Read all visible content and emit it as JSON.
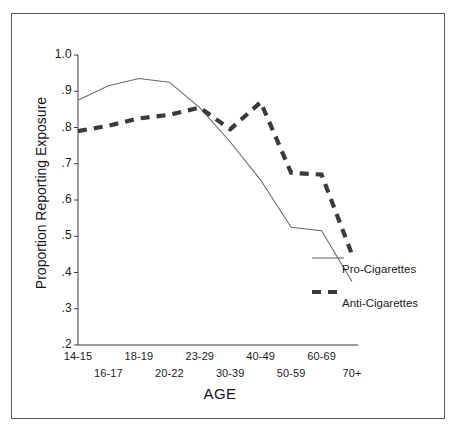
{
  "chart_data": {
    "type": "line",
    "title": "",
    "xlabel": "AGE",
    "ylabel": "Proportion Reporting Exposure",
    "categories": [
      "14-15",
      "16-17",
      "18-19",
      "20-22",
      "23-29",
      "30-39",
      "40-49",
      "50-59",
      "60-69",
      "70+"
    ],
    "ylim": [
      0.2,
      1.0
    ],
    "yticks": [
      "1.0",
      ".9",
      ".8",
      ".7",
      ".6",
      ".5",
      ".4",
      ".3",
      ".2"
    ],
    "ytick_values": [
      1.0,
      0.9,
      0.8,
      0.7,
      0.6,
      0.5,
      0.4,
      0.3,
      0.2
    ],
    "grid": false,
    "legend_position": "inside-right",
    "series": [
      {
        "name": "Pro-Cigarettes",
        "style": "solid-thin",
        "color": "#6b6b6b",
        "values": [
          0.875,
          0.915,
          0.935,
          0.925,
          0.855,
          0.76,
          0.655,
          0.525,
          0.515,
          0.375
        ]
      },
      {
        "name": "Anti-Cigarettes",
        "style": "dashed-thick",
        "color": "#3a3a3a",
        "values": [
          0.79,
          0.805,
          0.825,
          0.835,
          0.855,
          0.795,
          0.87,
          0.675,
          0.67,
          0.45
        ]
      }
    ]
  },
  "legend": {
    "entries": [
      {
        "label": "Pro-Cigarettes"
      },
      {
        "label": "Anti-Cigarettes"
      }
    ]
  }
}
